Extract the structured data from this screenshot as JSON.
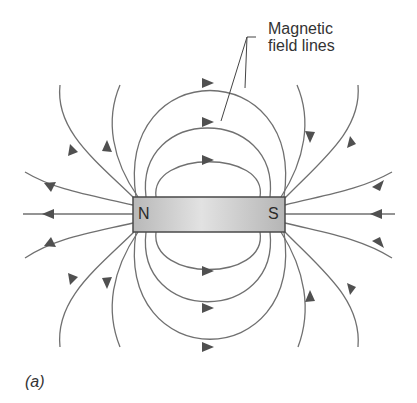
{
  "figure": {
    "caption": "(a)",
    "callout": {
      "line1": "Magnetic",
      "line2": "field lines"
    },
    "magnet": {
      "north_label": "N",
      "south_label": "S",
      "fill_color": "#c8c8c8",
      "border_color": "#4a4a4a"
    },
    "field_line_color": "#707070",
    "arrow_color": "#505050"
  }
}
